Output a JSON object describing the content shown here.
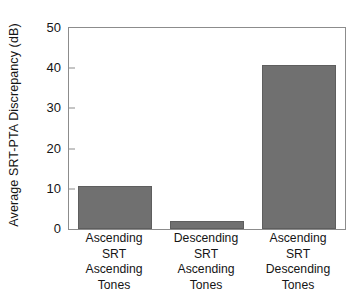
{
  "chart_data": {
    "type": "bar",
    "title": "",
    "xlabel": "",
    "ylabel": "Average SRT-PTA Discrepancy (dB)",
    "categories": [
      "Ascending SRT Ascending Tones",
      "Descending SRT Ascending Tones",
      "Ascending SRT Descending Tones"
    ],
    "category_lines": [
      [
        "Ascending",
        "SRT",
        "Ascending",
        "Tones"
      ],
      [
        "Descending",
        "SRT",
        "Ascending",
        "Tones"
      ],
      [
        "Ascending",
        "SRT",
        "Descending",
        "Tones"
      ]
    ],
    "values": [
      10.7,
      2.1,
      40.8
    ],
    "ylim": [
      0,
      50
    ],
    "yticks": [
      0,
      10,
      20,
      30,
      40,
      50
    ],
    "ytick_labels": [
      "0",
      "10",
      "20",
      "30",
      "40",
      "50"
    ],
    "grid": false,
    "legend": null,
    "bar_color": "#707070",
    "bar_edge_color": "#5e5e5e",
    "axis_color": "#8c8c8c",
    "background": "#ffffff"
  }
}
